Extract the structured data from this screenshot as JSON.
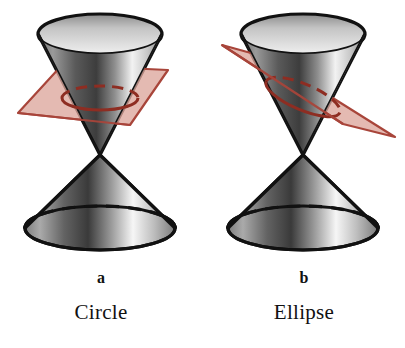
{
  "figure": {
    "background_color": "#ffffff",
    "width": 405,
    "height": 348
  },
  "colors": {
    "outline": "#111111",
    "cone_light": "#fbfbfb",
    "cone_mid": "#b9b9b9",
    "cone_dark": "#2a2a2a",
    "plane_fill": "#dca79c",
    "plane_edge": "#a8453a",
    "section_curve": "#8e2d22",
    "hidden_edge": "#111111",
    "label_text": "#111111"
  },
  "panels": [
    {
      "id": "circle",
      "letter": "a",
      "name": "Circle",
      "plane_orientation": "horizontal",
      "section_shape": "circle",
      "description": "Horizontal plane cutting the upper nappe of a double cone, producing a circular cross-section",
      "cone": {
        "type": "double-cone",
        "apex": {
          "x": 100,
          "y": 155
        },
        "top_rim": {
          "cx": 100,
          "cy": 34,
          "rx": 62,
          "ry": 20
        },
        "bottom_rim": {
          "cx": 100,
          "cy": 228,
          "rx": 75,
          "ry": 22
        }
      },
      "cutting_plane": {
        "type": "parallelogram",
        "points": "18,113 62,65 168,70 130,125",
        "tilt_degrees": 0
      },
      "section_curve": {
        "cx": 100,
        "cy": 98,
        "rx": 38,
        "ry": 12,
        "back_half": "dashed",
        "front_half": "solid"
      }
    },
    {
      "id": "ellipse",
      "letter": "b",
      "name": "Ellipse",
      "plane_orientation": "tilted",
      "section_shape": "ellipse",
      "description": "Oblique plane cutting the upper nappe of a double cone, producing an elliptical cross-section",
      "cone": {
        "type": "double-cone",
        "apex": {
          "x": 100,
          "y": 155
        },
        "top_rim": {
          "cx": 100,
          "cy": 34,
          "rx": 62,
          "ry": 20
        },
        "bottom_rim": {
          "cx": 100,
          "cy": 228,
          "rx": 75,
          "ry": 22
        }
      },
      "cutting_plane": {
        "type": "parallelogram",
        "points": "19,45 66,58 192,137 140,124",
        "tilt_degrees": 28
      },
      "section_curve": {
        "cx": 100,
        "cy": 97,
        "rx": 40,
        "ry": 13,
        "rotation_degrees": 23,
        "back_half": "dashed",
        "front_half": "solid"
      }
    }
  ]
}
